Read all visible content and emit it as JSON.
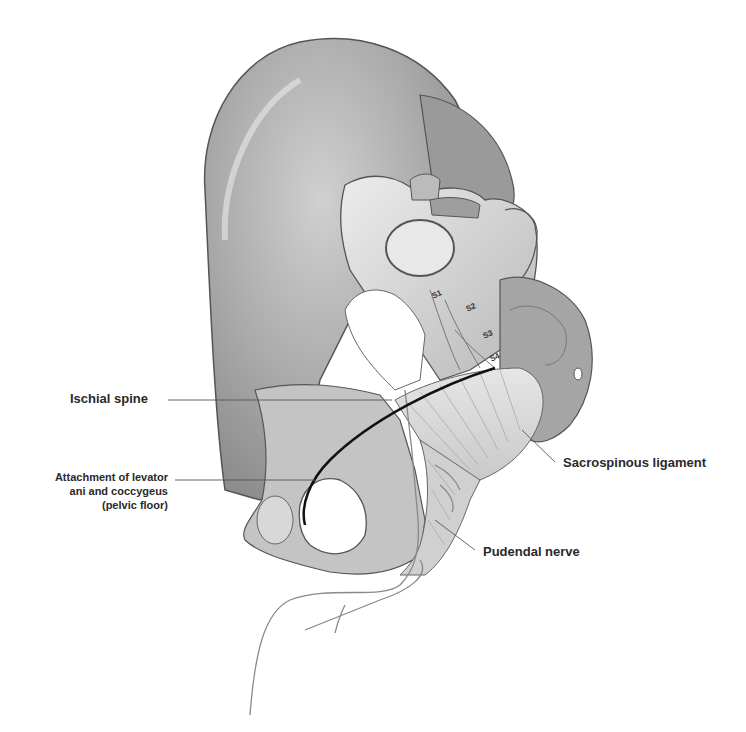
{
  "figure": {
    "colors": {
      "background": "#ffffff",
      "bone_light": "#e4e4e4",
      "bone_mid": "#bdbdbd",
      "bone_dark": "#8a8a8a",
      "outline": "#555555",
      "label_text": "#2a2a2a",
      "leader_line": "#555555",
      "pelvic_floor_line": "#111111"
    }
  },
  "labels": {
    "ischial_spine": "Ischial spine",
    "levator_line1": "Attachment of levator",
    "levator_line2": "ani  and coccygeus",
    "levator_line3": "(pelvic floor)",
    "sacrospinous": "Sacrospinous ligament",
    "pudendal": "Pudendal nerve"
  },
  "sacral_roots": [
    "S1",
    "S2",
    "S3",
    "S4"
  ]
}
